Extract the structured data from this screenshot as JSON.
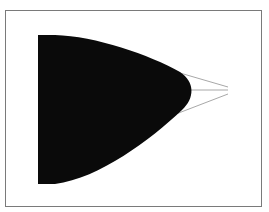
{
  "diagram": {
    "shape": {
      "fill": "#0a0a0a",
      "description": "bullet-shaped filled region with flat left edge and rounded apex pointing right"
    },
    "lines": {
      "stroke": "#a8a8a8",
      "count": 3,
      "converge_point": [
        228,
        90
      ]
    },
    "frame": {
      "stroke": "#7a7a7a"
    }
  }
}
